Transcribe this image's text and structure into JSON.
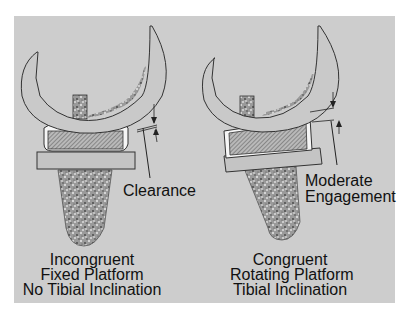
{
  "figure": {
    "background_color": "#cdcdcd",
    "panels": [
      {
        "id": "left",
        "callout": "Clearance",
        "caption": [
          "Incongruent",
          "Fixed Platform",
          "No Tibial Inclination"
        ]
      },
      {
        "id": "right",
        "callout_lines": [
          "Moderate",
          "Engagement"
        ],
        "caption": [
          "Congruent",
          "Rotating Platform",
          "Tibial Inclination"
        ]
      }
    ]
  }
}
